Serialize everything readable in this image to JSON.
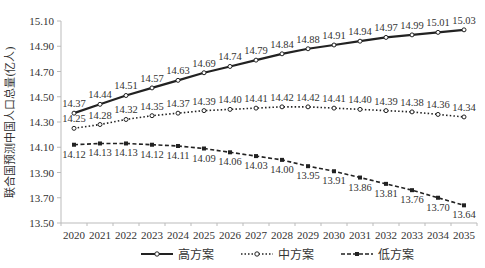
{
  "chart_data": {
    "type": "line",
    "title": "",
    "xlabel": "",
    "ylabel": "联合国预测中国人口总量(亿人)",
    "ylim": [
      13.5,
      15.1
    ],
    "yticks": [
      "15.10",
      "14.90",
      "14.70",
      "14.50",
      "14.30",
      "14.10",
      "13.90",
      "13.70",
      "13.50"
    ],
    "grid": false,
    "legend_position": "bottom",
    "categories": [
      "2020",
      "2021",
      "2022",
      "2023",
      "2024",
      "2025",
      "2026",
      "2027",
      "2028",
      "2029",
      "2030",
      "2031",
      "2032",
      "2033",
      "2034",
      "2035"
    ],
    "series": [
      {
        "name": "高方案",
        "style": "solid",
        "marker": "circle",
        "values": [
          14.37,
          14.44,
          14.51,
          14.57,
          14.63,
          14.69,
          14.74,
          14.79,
          14.84,
          14.88,
          14.91,
          14.94,
          14.97,
          14.99,
          15.01,
          15.03
        ],
        "labels": [
          "14.37",
          "14.44",
          "14.51",
          "14.57",
          "14.63",
          "14.69",
          "14.74",
          "14.79",
          "14.84",
          "14.88",
          "14.91",
          "14.94",
          "14.97",
          "14.99",
          "15.01",
          "15.03"
        ]
      },
      {
        "name": "中方案",
        "style": "dotted",
        "marker": "circle",
        "values": [
          14.25,
          14.28,
          14.32,
          14.35,
          14.37,
          14.39,
          14.4,
          14.41,
          14.42,
          14.42,
          14.41,
          14.4,
          14.39,
          14.38,
          14.36,
          14.34
        ],
        "labels": [
          "14.25",
          "14.28",
          "14.32",
          "14.35",
          "14.37",
          "14.39",
          "14.40",
          "14.41",
          "14.42",
          "14.42",
          "14.41",
          "14.40",
          "14.39",
          "14.38",
          "14.36",
          "14.34"
        ]
      },
      {
        "name": "低方案",
        "style": "dashed",
        "marker": "square",
        "values": [
          14.12,
          14.13,
          14.13,
          14.12,
          14.11,
          14.09,
          14.06,
          14.03,
          14.0,
          13.95,
          13.91,
          13.86,
          13.81,
          13.76,
          13.7,
          13.64
        ],
        "labels": [
          "14.12",
          "14.13",
          "14.13",
          "14.12",
          "14.11",
          "14.09",
          "14.06",
          "14.03",
          "14.00",
          "13.95",
          "13.91",
          "13.86",
          "13.81",
          "13.76",
          "13.70",
          "13.64"
        ]
      }
    ]
  },
  "legend": {
    "high": "高方案",
    "mid": "中方案",
    "low": "低方案"
  },
  "colors": {
    "line": "#222222",
    "axis": "#bbbbbb",
    "text": "#333333"
  }
}
